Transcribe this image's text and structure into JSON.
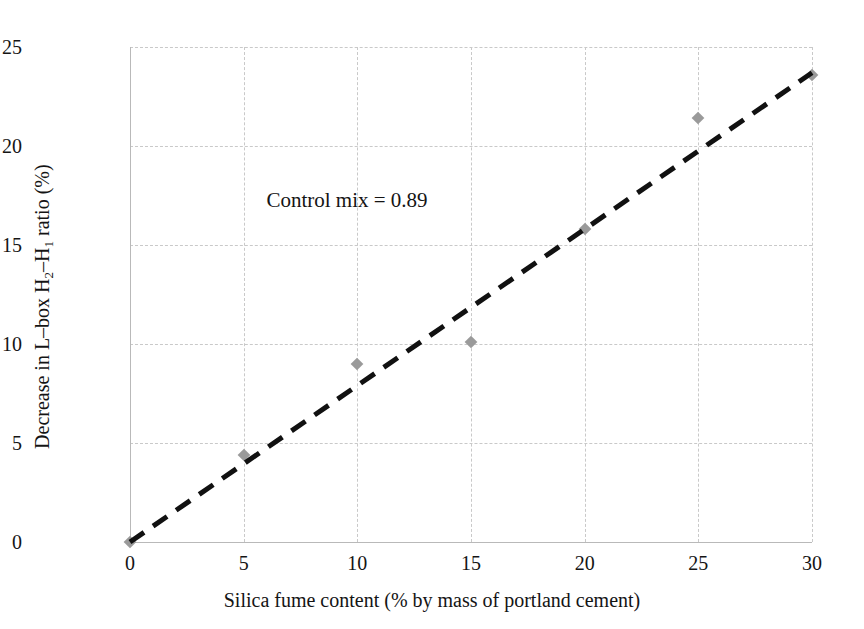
{
  "chart_data": {
    "type": "scatter",
    "title": "",
    "xlabel": "Silica fume content (% by mass of portland cement)",
    "ylabel_parts": {
      "pre": "Decrease in L–box H",
      "sub1": "2",
      "mid": "–H",
      "sub2": "1",
      "post": " ratio (%)"
    },
    "ylabel": "Decrease in L-box H2–H1 ratio (%)",
    "x": [
      0,
      5,
      10,
      15,
      20,
      25,
      30
    ],
    "values": [
      0.0,
      4.4,
      9.0,
      10.1,
      15.8,
      21.4,
      23.6
    ],
    "series": [
      {
        "name": "Decrease in L-box H2-H1 ratio",
        "marker": "diamond",
        "marker_color": "#9a9a9a",
        "points": [
          {
            "x": 0,
            "y": 0.0
          },
          {
            "x": 5,
            "y": 4.4
          },
          {
            "x": 10,
            "y": 9.0
          },
          {
            "x": 15,
            "y": 10.1
          },
          {
            "x": 20,
            "y": 15.8
          },
          {
            "x": 25,
            "y": 21.4
          },
          {
            "x": 30,
            "y": 23.6
          }
        ]
      }
    ],
    "trendline": {
      "style": "dashed",
      "color": "#111111",
      "width": 5,
      "x_start": 0,
      "y_start": 0.0,
      "x_end": 30,
      "y_end": 23.7
    },
    "xlim": [
      0,
      30
    ],
    "ylim": [
      0,
      25
    ],
    "xticks": [
      "0",
      "5",
      "10",
      "15",
      "20",
      "25",
      "30"
    ],
    "yticks": [
      "0",
      "5",
      "10",
      "15",
      "20",
      "25"
    ],
    "xtick_values": [
      0,
      5,
      10,
      15,
      20,
      25,
      30
    ],
    "ytick_values": [
      0,
      5,
      10,
      15,
      20,
      25
    ],
    "grid": true,
    "grid_color": "#c9c9c9",
    "legend": null,
    "annotations": [
      {
        "text": "Control mix = 0.89",
        "x": 6.0,
        "y": 17.2
      }
    ]
  }
}
